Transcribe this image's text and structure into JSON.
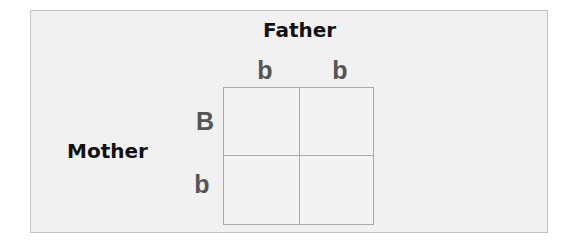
{
  "diagram": {
    "type": "punnett-square",
    "father_label": "Father",
    "mother_label": "Mother",
    "father_alleles": [
      "b",
      "b"
    ],
    "mother_alleles": [
      "B",
      "b"
    ],
    "cells": [
      [
        "",
        ""
      ],
      [
        "",
        ""
      ]
    ]
  },
  "colors": {
    "panel_background": "#f1f1f1",
    "panel_border": "#c4c4c4",
    "grid_line": "#a9a9a9",
    "title_text": "#111111",
    "allele_text": "#555555"
  }
}
